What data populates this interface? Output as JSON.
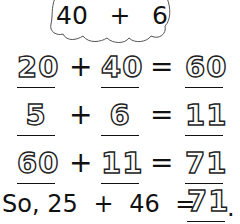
{
  "cloud": {
    "left": "40",
    "operator": "+",
    "right": "6"
  },
  "equations": [
    {
      "a": "20",
      "op": "+",
      "b": "40",
      "eq": "=",
      "result": "60"
    },
    {
      "a": "5",
      "op": "+",
      "b": "6",
      "eq": "=",
      "result": "11"
    },
    {
      "a": "60",
      "op": "+",
      "b": "11",
      "eq": "=",
      "result": "71"
    }
  ],
  "conclusion": {
    "prefix": "So,",
    "a": "25",
    "op": "+",
    "b": "46",
    "eq": "=",
    "answer": "71",
    "period": "."
  }
}
